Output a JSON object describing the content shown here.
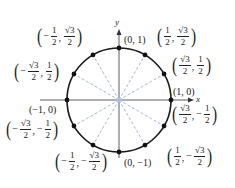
{
  "diagram": {
    "type": "unit-circle",
    "center_px": [
      119,
      100
    ],
    "radius_px": 52,
    "axes": {
      "x_label": "x",
      "y_label": "y"
    },
    "colors": {
      "circle": "#1a1a1a",
      "axis": "#333333",
      "radial_lines": "#8fa4c8",
      "points": "#111111"
    },
    "points": [
      {
        "angle_deg": 0,
        "label": "(1, 0)"
      },
      {
        "angle_deg": 30,
        "label": "(√3/2, 1/2)",
        "x": {
          "sign": "",
          "num": "√3",
          "den": "2"
        },
        "y": {
          "sign": "",
          "num": "1",
          "den": "2"
        }
      },
      {
        "angle_deg": 60,
        "label": "(1/2, √3/2)",
        "x": {
          "sign": "",
          "num": "1",
          "den": "2"
        },
        "y": {
          "sign": "",
          "num": "√3",
          "den": "2"
        }
      },
      {
        "angle_deg": 90,
        "label": "(0, 1)"
      },
      {
        "angle_deg": 120,
        "label": "(−1/2, √3/2)",
        "x": {
          "sign": "−",
          "num": "1",
          "den": "2"
        },
        "y": {
          "sign": "",
          "num": "√3",
          "den": "2"
        }
      },
      {
        "angle_deg": 150,
        "label": "(−√3/2, 1/2)",
        "x": {
          "sign": "−",
          "num": "√3",
          "den": "2"
        },
        "y": {
          "sign": "",
          "num": "1",
          "den": "2"
        }
      },
      {
        "angle_deg": 180,
        "label": "(−1, 0)"
      },
      {
        "angle_deg": 210,
        "label": "(−√3/2, −1/2)",
        "x": {
          "sign": "−",
          "num": "√3",
          "den": "2"
        },
        "y": {
          "sign": "−",
          "num": "1",
          "den": "2"
        }
      },
      {
        "angle_deg": 240,
        "label": "(−1/2, −√3/2)",
        "x": {
          "sign": "−",
          "num": "1",
          "den": "2"
        },
        "y": {
          "sign": "−",
          "num": "√3",
          "den": "2"
        }
      },
      {
        "angle_deg": 270,
        "label": "(0, −1)"
      },
      {
        "angle_deg": 300,
        "label": "(1/2, −√3/2)",
        "x": {
          "sign": "",
          "num": "1",
          "den": "2"
        },
        "y": {
          "sign": "−",
          "num": "√3",
          "den": "2"
        }
      },
      {
        "angle_deg": 330,
        "label": "(√3/2, −1/2)",
        "x": {
          "sign": "",
          "num": "√3",
          "den": "2"
        },
        "y": {
          "sign": "−",
          "num": "1",
          "den": "2"
        }
      }
    ]
  }
}
